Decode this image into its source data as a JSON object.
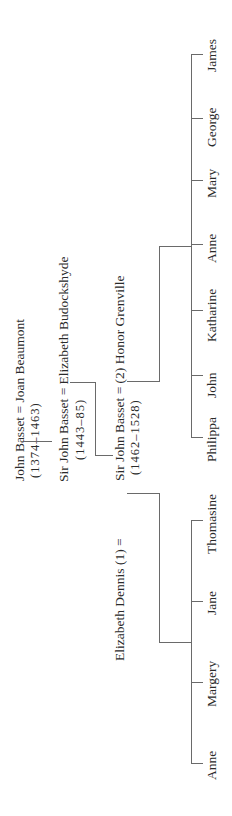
{
  "tree": {
    "generation1": {
      "couple": "John Basset = Joan Beaumont",
      "dates": "(1374–1463)"
    },
    "generation2": {
      "couple": "Sir John Basset = Elizabeth Budockshyde",
      "dates": "(1443–85)"
    },
    "generation3": {
      "couple_second": "Sir John Basset = (2) Honor Grenville",
      "couple_first_prefix": "Elizabeth Dennis (1) =",
      "dates": "(1462–1528)"
    },
    "children_second_marriage": [
      "James",
      "George",
      "Mary",
      "Anne",
      "Katharine",
      "John",
      "Philippa"
    ],
    "children_first_marriage": [
      "Thomasine",
      "Jane",
      "Margery",
      "Anne"
    ]
  },
  "style": {
    "line_color": "#6a6a6a",
    "text_color": "#2a2a2a"
  }
}
